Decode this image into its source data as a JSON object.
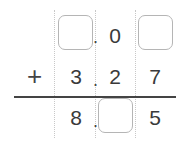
{
  "problem": {
    "operator": "+",
    "row1": {
      "ones": null,
      "decimal_point": ".",
      "tenths": "0",
      "hundredths": null
    },
    "row2": {
      "ones": "3",
      "decimal_point": ".",
      "tenths": "2",
      "hundredths": "7"
    },
    "result": {
      "ones": "8",
      "decimal_point": ".",
      "tenths": null,
      "hundredths": "5"
    },
    "blank_boxes": [
      "row1-ones",
      "row1-hundredths",
      "result-tenths"
    ]
  }
}
